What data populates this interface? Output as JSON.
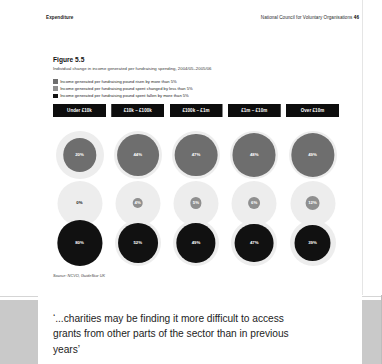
{
  "running_head": {
    "left": "Expenditure",
    "right": "National Council for Voluntary Organisations",
    "page_number": "46"
  },
  "figure": {
    "number": "Figure 5.5",
    "subtitle": "Individual change in income generated per fundraising spending, 2004/05–2005/06",
    "source": "Source: NCVO, GuideStar UK",
    "legend": [
      {
        "label": "Income generated per fundraising pound risen by more than 5%",
        "color": "#6e6e6e"
      },
      {
        "label": "Income generated per fundraising pound spent changed by less than 5%",
        "color": "#8f8f8f"
      },
      {
        "label": "Income generated per fundraising pound spent fallen by more than 5%",
        "color": "#111111"
      }
    ]
  },
  "chart_data": {
    "type": "bar",
    "title": "Figure 5.5",
    "subtitle": "Individual change in income generated per fundraising spending, 2004/05–2005/06",
    "xlabel": "",
    "ylabel": "",
    "categories": [
      "Under £10k",
      "£10k – £100k",
      "£100k – £1m",
      "£1m – £10m",
      "Over £10m"
    ],
    "series": [
      {
        "name": "Income generated per fundraising pound risen by more than 5%",
        "color": "#6e6e6e",
        "values": [
          20,
          44,
          47,
          48,
          49
        ],
        "labels": [
          "20%",
          "44%",
          "47%",
          "48%",
          "49%"
        ]
      },
      {
        "name": "Income generated per fundraising pound spent changed by less than 5%",
        "color": "#8f8f8f",
        "values": [
          0,
          4,
          5,
          6,
          12
        ],
        "labels": [
          "0%",
          "4%",
          "5%",
          "6%",
          "12%"
        ]
      },
      {
        "name": "Income generated per fundraising pound spent fallen by more than 5%",
        "color": "#111111",
        "values": [
          80,
          52,
          49,
          47,
          39
        ],
        "labels": [
          "80%",
          "52%",
          "49%",
          "47%",
          "39%"
        ]
      }
    ],
    "ylim": [
      0,
      100
    ],
    "grid": false,
    "legend_position": "top"
  },
  "pull_quote": "‘...charities may be finding it more difficult to access grants from other parts of the sector than in previous years’"
}
